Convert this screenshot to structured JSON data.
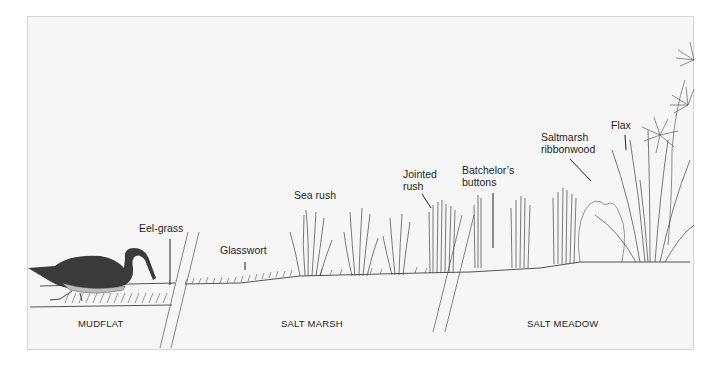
{
  "diagram": {
    "zones": [
      {
        "id": "mudflat",
        "label": "MUDFLAT"
      },
      {
        "id": "salt-marsh",
        "label": "SALT MARSH"
      },
      {
        "id": "salt-meadow",
        "label": "SALT MEADOW"
      }
    ],
    "plants": [
      {
        "id": "eel-grass",
        "label": "Eel-grass"
      },
      {
        "id": "glasswort",
        "label": "Glasswort"
      },
      {
        "id": "sea-rush",
        "label": "Sea rush"
      },
      {
        "id": "jointed-rush",
        "label_line1": "Jointed",
        "label_line2": "rush"
      },
      {
        "id": "batchelors-buttons",
        "label_line1": "Batchelor’s",
        "label_line2": "buttons"
      },
      {
        "id": "saltmarsh-ribbonwood",
        "label_line1": "Saltmarsh",
        "label_line2": "ribbonwood"
      },
      {
        "id": "flax",
        "label": "Flax"
      }
    ],
    "animal": {
      "id": "black-swan",
      "label": ""
    },
    "colors": {
      "background": "#f6f6f6",
      "border": "#d6d6d6",
      "ink": "#2a2a2a",
      "swan": "#3a3a3a"
    }
  }
}
